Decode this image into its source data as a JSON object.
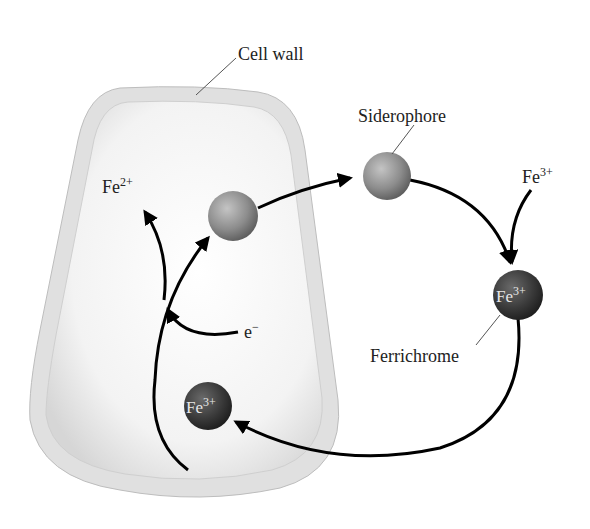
{
  "diagram": {
    "labels": {
      "cell_wall": "Cell wall",
      "siderophore": "Siderophore",
      "fe3_outside": "Fe",
      "fe3_outside_sup": "3+",
      "fe2": "Fe",
      "fe2_sup": "2+",
      "electron": "e",
      "electron_sup": "−",
      "ferrichrome": "Ferrichrome",
      "ferrichrome_ball": "Fe",
      "ferrichrome_ball_sup": "3+",
      "inside_ball": "Fe",
      "inside_ball_sup": "3+"
    },
    "colors": {
      "cell_wall": "#e2e2e2",
      "cell_interior": "#f2f2f2",
      "siderophore_ball": "#8c8c8c",
      "ferrichrome_ball": "#3a3a3a",
      "arrow": "#000000"
    }
  }
}
